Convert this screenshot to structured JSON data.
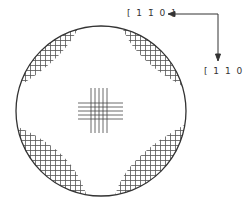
{
  "diagram": {
    "labels": {
      "direction_horizontal": "[ 1 1̄ 0 ]",
      "direction_vertical": "[ 1 1 0 ]"
    },
    "wafer": {
      "cx": 101,
      "cy": 111,
      "r": 85
    },
    "colors": {
      "line": "#333333",
      "hatch": "#555555",
      "background": "#ffffff"
    }
  }
}
